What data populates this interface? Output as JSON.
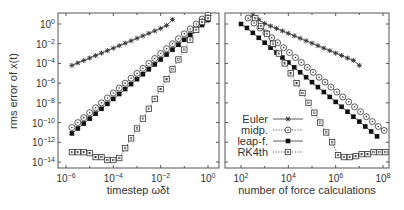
{
  "chart_data": [
    {
      "type": "line",
      "panel": "left",
      "xscale": "log",
      "yscale": "log",
      "xlabel": "timestep ωδt",
      "ylabel": "rms error of x(t)",
      "xlim": [
        3e-07,
        3.0
      ],
      "ylim": [
        1e-15,
        10.0
      ],
      "xticks": [
        "10^-6",
        "10^-4",
        "10^-2",
        "10^0"
      ],
      "yticks": [
        "10^0",
        "10^-2",
        "10^-4",
        "10^-6",
        "10^-8",
        "10^-10",
        "10^-12",
        "10^-14"
      ],
      "series": [
        {
          "name": "Euler",
          "marker": "star",
          "line": "solid",
          "x_log10": [
            -5.75,
            -5.5,
            -5.25,
            -5.0,
            -4.75,
            -4.5,
            -4.25,
            -4.0,
            -3.75,
            -3.5,
            -3.25,
            -3.0,
            -2.75,
            -2.5,
            -2.25,
            -2.0,
            -1.75,
            -1.5
          ],
          "y_log10": [
            -4.2,
            -3.95,
            -3.7,
            -3.45,
            -3.2,
            -2.95,
            -2.7,
            -2.45,
            -2.2,
            -1.95,
            -1.7,
            -1.45,
            -1.2,
            -0.95,
            -0.7,
            -0.45,
            -0.15,
            0.45
          ]
        },
        {
          "name": "midp.",
          "marker": "circle-open",
          "line": "dotted",
          "x_log10": [
            -5.75,
            -5.5,
            -5.25,
            -5.0,
            -4.75,
            -4.5,
            -4.25,
            -4.0,
            -3.75,
            -3.5,
            -3.25,
            -3.0,
            -2.75,
            -2.5,
            -2.25,
            -2.0,
            -1.75,
            -1.5,
            -1.25,
            -1.0,
            -0.75,
            -0.5,
            -0.25,
            0.0
          ],
          "y_log10": [
            -10.5,
            -10.0,
            -9.5,
            -9.0,
            -8.5,
            -8.0,
            -7.5,
            -7.0,
            -6.5,
            -6.0,
            -5.5,
            -5.0,
            -4.5,
            -4.0,
            -3.5,
            -3.0,
            -2.5,
            -2.0,
            -1.5,
            -1.0,
            -0.5,
            0.0,
            0.5,
            0.9
          ]
        },
        {
          "name": "leap-f.",
          "marker": "square-filled",
          "line": "solid",
          "x_log10": [
            -5.75,
            -5.5,
            -5.25,
            -5.0,
            -4.75,
            -4.5,
            -4.25,
            -4.0,
            -3.75,
            -3.5,
            -3.25,
            -3.0,
            -2.75,
            -2.5,
            -2.25,
            -2.0,
            -1.75,
            -1.5,
            -1.25,
            -1.0,
            -0.75,
            -0.5,
            -0.25,
            0.0
          ],
          "y_log10": [
            -11.1,
            -10.6,
            -10.1,
            -9.6,
            -9.1,
            -8.6,
            -8.1,
            -7.6,
            -7.1,
            -6.6,
            -6.1,
            -5.6,
            -5.1,
            -4.6,
            -4.1,
            -3.6,
            -3.1,
            -2.6,
            -2.1,
            -1.6,
            -1.1,
            -0.6,
            -0.1,
            0.4
          ]
        },
        {
          "name": "RK4th",
          "marker": "square-open",
          "line": "dotted",
          "x_log10": [
            -5.75,
            -5.5,
            -5.25,
            -5.0,
            -4.75,
            -4.5,
            -4.25,
            -4.0,
            -3.75,
            -3.5,
            -3.25,
            -3.0,
            -2.75,
            -2.5,
            -2.25,
            -2.0,
            -1.75,
            -1.5,
            -1.25,
            -1.0,
            -0.75,
            -0.5,
            -0.25,
            0.0
          ],
          "y_log10": [
            -13.0,
            -13.0,
            -13.0,
            -13.1,
            -13.5,
            -13.5,
            -13.8,
            -13.8,
            -13.6,
            -12.6,
            -11.6,
            -10.6,
            -9.6,
            -8.6,
            -7.6,
            -6.6,
            -5.6,
            -4.6,
            -3.6,
            -2.6,
            -1.6,
            -0.6,
            0.2,
            0.6
          ]
        }
      ]
    },
    {
      "type": "line",
      "panel": "right",
      "xscale": "log",
      "yscale": "log",
      "xlabel": "number of force calculations",
      "ylabel": "",
      "xlim": [
        30,
        300000000.0
      ],
      "ylim": [
        1e-15,
        10.0
      ],
      "xticks": [
        "10^2",
        "10^4",
        "10^6",
        "10^8"
      ],
      "legend": {
        "position": "lower-left",
        "entries": [
          "Euler",
          "midp.",
          "leap-f.",
          "RK4th"
        ]
      },
      "series": [
        {
          "name": "Euler",
          "marker": "star",
          "line": "solid",
          "x_log10": [
            2.5,
            2.75,
            3.0,
            3.25,
            3.5,
            3.75,
            4.0,
            4.25,
            4.5,
            4.75,
            5.0,
            5.25,
            5.5,
            5.75,
            6.0,
            6.25,
            6.5,
            6.75,
            7.0
          ],
          "y_log10": [
            0.9,
            0.45,
            0.05,
            -0.2,
            -0.45,
            -0.7,
            -0.95,
            -1.2,
            -1.45,
            -1.7,
            -1.95,
            -2.2,
            -2.45,
            -2.7,
            -2.95,
            -3.2,
            -3.45,
            -3.7,
            -4.2
          ]
        },
        {
          "name": "midp.",
          "marker": "circle-open",
          "line": "dotted",
          "x_log10": [
            2.3,
            2.55,
            2.8,
            3.05,
            3.3,
            3.55,
            3.8,
            4.05,
            4.3,
            4.55,
            4.8,
            5.05,
            5.3,
            5.55,
            5.8,
            6.05,
            6.3,
            6.55,
            6.8,
            7.05,
            7.3,
            7.55,
            7.8,
            8.05
          ],
          "y_log10": [
            0.6,
            0.1,
            -0.4,
            -0.9,
            -1.4,
            -1.9,
            -2.4,
            -2.9,
            -3.4,
            -3.9,
            -4.4,
            -4.9,
            -5.4,
            -5.9,
            -6.4,
            -6.9,
            -7.4,
            -7.9,
            -8.4,
            -8.9,
            -9.4,
            -9.9,
            -10.4,
            -10.8
          ]
        },
        {
          "name": "leap-f.",
          "marker": "square-filled",
          "line": "solid",
          "x_log10": [
            2.0,
            2.25,
            2.5,
            2.75,
            3.0,
            3.25,
            3.5,
            3.75,
            4.0,
            4.25,
            4.5,
            4.75,
            5.0,
            5.25,
            5.5,
            5.75,
            6.0,
            6.25,
            6.5,
            6.75,
            7.0,
            7.25,
            7.5,
            7.75
          ],
          "y_log10": [
            0.0,
            -0.4,
            -0.9,
            -1.4,
            -1.9,
            -2.4,
            -2.9,
            -3.4,
            -3.9,
            -4.4,
            -4.9,
            -5.4,
            -5.9,
            -6.4,
            -6.9,
            -7.4,
            -7.9,
            -8.4,
            -8.9,
            -9.4,
            -9.9,
            -10.4,
            -10.9,
            -11.4
          ]
        },
        {
          "name": "RK4th",
          "marker": "square-open",
          "line": "dotted",
          "x_log10": [
            2.6,
            2.85,
            3.1,
            3.35,
            3.6,
            3.85,
            4.1,
            4.35,
            4.6,
            4.85,
            5.1,
            5.35,
            5.6,
            5.85,
            6.1,
            6.35,
            6.6,
            6.85,
            7.1,
            7.35,
            7.6,
            7.85,
            8.1,
            8.35
          ],
          "y_log10": [
            0.6,
            -0.2,
            -1.0,
            -2.0,
            -3.0,
            -4.0,
            -5.0,
            -6.0,
            -7.0,
            -8.0,
            -9.0,
            -10.0,
            -11.0,
            -12.0,
            -13.3,
            -13.5,
            -13.5,
            -13.4,
            -13.2,
            -13.2,
            -13.0,
            -13.0,
            -13.0,
            -13.0
          ]
        }
      ]
    }
  ],
  "labels": {
    "ylabel": "rms error of x(t)",
    "left_xlabel": "timestep ωδt",
    "right_xlabel": "number of force calculations",
    "yticks": [
      {
        "base": "10",
        "exp": "0"
      },
      {
        "base": "10",
        "exp": "−2"
      },
      {
        "base": "10",
        "exp": "−4"
      },
      {
        "base": "10",
        "exp": "−6"
      },
      {
        "base": "10",
        "exp": "−8"
      },
      {
        "base": "10",
        "exp": "−10"
      },
      {
        "base": "10",
        "exp": "−12"
      },
      {
        "base": "10",
        "exp": "−14"
      }
    ],
    "left_xticks": [
      {
        "base": "10",
        "exp": "−6"
      },
      {
        "base": "10",
        "exp": "−4"
      },
      {
        "base": "10",
        "exp": "−2"
      },
      {
        "base": "10",
        "exp": "0"
      }
    ],
    "right_xticks": [
      {
        "base": "10",
        "exp": "2"
      },
      {
        "base": "10",
        "exp": "4"
      },
      {
        "base": "10",
        "exp": "6"
      },
      {
        "base": "10",
        "exp": "8"
      }
    ],
    "legend": [
      "Euler",
      "midp.",
      "leap-f.",
      "RK4th"
    ]
  },
  "colors": {
    "axis": "#555555",
    "series": "#333333",
    "text": "#333333"
  }
}
